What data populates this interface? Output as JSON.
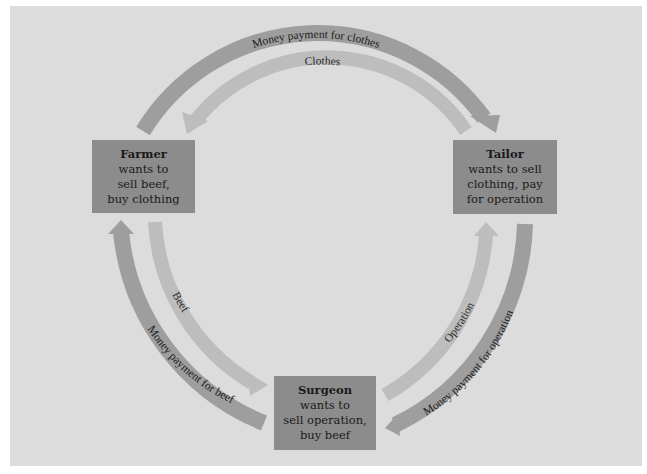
{
  "diagram": {
    "nodes": {
      "farmer": {
        "name": "Farmer",
        "lines": [
          "wants to",
          "sell beef,",
          "buy clothing"
        ]
      },
      "tailor": {
        "name": "Tailor",
        "lines": [
          "wants to sell",
          "clothing, pay",
          "for operation"
        ]
      },
      "surgeon": {
        "name": "Surgeon",
        "lines": [
          "wants to",
          "sell operation,",
          "buy beef"
        ]
      }
    },
    "flows": {
      "money_for_clothes": "Money payment for clothes",
      "clothes": "Clothes",
      "beef": "Beef",
      "money_for_beef": "Money payment for beef",
      "operation": "Operation",
      "money_for_operation": "Money payment for operation"
    },
    "colors": {
      "background": "#dcdcdc",
      "box": "#8c8c8c",
      "money_arrow": "#9e9e9e",
      "goods_arrow": "#bdbdbd"
    }
  }
}
